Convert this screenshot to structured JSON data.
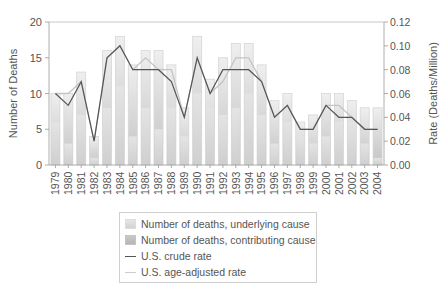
{
  "chart_data": {
    "type": "bar",
    "title": "",
    "xlabel": "",
    "ylabel": "Number of Deaths",
    "y2label": "Rate (Deaths/Million)",
    "ylim": [
      0,
      20
    ],
    "y2lim": [
      0,
      0.12
    ],
    "yticks": [
      "0",
      "5",
      "10",
      "15",
      "20"
    ],
    "y2ticks": [
      "0.00",
      "0.02",
      "0.04",
      "0.06",
      "0.08",
      "0.10",
      "0.12"
    ],
    "categories": [
      "1979",
      "1980",
      "1981",
      "1982",
      "1983",
      "1984",
      "1985",
      "1986",
      "1987",
      "1988",
      "1989",
      "1990",
      "1991",
      "1992",
      "1993",
      "1994",
      "1995",
      "1996",
      "1997",
      "1998",
      "1999",
      "2000",
      "2001",
      "2002",
      "2003",
      "2004"
    ],
    "series": [
      {
        "name": "Number of deaths, underlying cause",
        "type": "bar",
        "axis": "left",
        "values": [
          6,
          3,
          7,
          1,
          8,
          11,
          4,
          8,
          5,
          8,
          4,
          10,
          8,
          7,
          8,
          10,
          7,
          3,
          6,
          4,
          3,
          4,
          6,
          6,
          3,
          1
        ]
      },
      {
        "name": "Number of deaths, contributing cause",
        "type": "bar",
        "axis": "left",
        "stacked_total": true,
        "values": [
          4,
          7,
          6,
          3,
          8,
          7,
          10,
          8,
          11,
          6,
          4,
          8,
          4,
          8,
          9,
          7,
          7,
          6,
          4,
          2,
          4,
          6,
          4,
          3,
          5,
          7
        ]
      },
      {
        "name": "U.S. crude rate",
        "type": "line",
        "axis": "right",
        "color": "#555555",
        "values": [
          0.06,
          0.05,
          0.07,
          0.02,
          0.09,
          0.1,
          0.08,
          0.08,
          0.08,
          0.07,
          0.04,
          0.09,
          0.06,
          0.08,
          0.08,
          0.08,
          0.07,
          0.04,
          0.05,
          0.03,
          0.03,
          0.05,
          0.04,
          0.04,
          0.03,
          0.03
        ]
      },
      {
        "name": "U.S. age-adjusted rate",
        "type": "line",
        "axis": "right",
        "color": "#bbbbbb",
        "values": [
          0.06,
          0.06,
          0.07,
          0.02,
          0.09,
          0.1,
          0.08,
          0.09,
          0.08,
          0.08,
          0.04,
          0.09,
          0.06,
          0.07,
          0.09,
          0.09,
          0.07,
          0.04,
          0.05,
          0.03,
          0.03,
          0.05,
          0.05,
          0.04,
          0.03,
          0.03
        ]
      }
    ],
    "legend_position": "bottom",
    "grid": false
  },
  "legend": {
    "items": [
      {
        "label": "Number of deaths, underlying cause"
      },
      {
        "label": "Number of deaths, contributing cause"
      },
      {
        "label": "U.S. crude rate"
      },
      {
        "label": "U.S. age-adjusted rate"
      }
    ]
  }
}
